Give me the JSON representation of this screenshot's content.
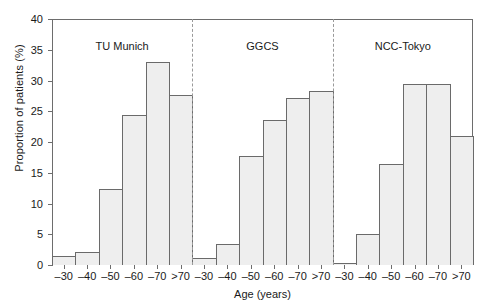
{
  "chart_data": {
    "type": "bar",
    "title": "",
    "subtitle": "",
    "xlabel": "Age (years)",
    "ylabel": "Proportion of patients (%)",
    "ylim": [
      0,
      40
    ],
    "yticks": [
      0,
      5,
      10,
      15,
      20,
      25,
      30,
      35,
      40
    ],
    "ytick_labels": [
      "0",
      "5",
      "10",
      "15",
      "20",
      "25",
      "30",
      "35",
      "40"
    ],
    "grid": false,
    "legend": "none",
    "legend_position": "none",
    "categories": [
      "–30",
      "–40",
      "–50",
      "–60",
      "–70",
      ">70"
    ],
    "panels": [
      {
        "label": "TU Munich",
        "values": [
          1.5,
          2.1,
          12.4,
          24.4,
          33.0,
          27.7
        ]
      },
      {
        "label": "GGCS",
        "values": [
          1.2,
          3.4,
          17.8,
          23.6,
          27.1,
          28.3
        ]
      },
      {
        "label": "NCC-Tokyo",
        "values": [
          0.4,
          5.0,
          16.4,
          29.4,
          29.4,
          20.9
        ]
      }
    ],
    "series": [
      {
        "name": "TU Munich",
        "values": [
          1.5,
          2.1,
          12.4,
          24.4,
          33.0,
          27.7
        ]
      },
      {
        "name": "GGCS",
        "values": [
          1.2,
          3.4,
          17.8,
          23.6,
          27.1,
          28.3
        ]
      },
      {
        "name": "NCC-Tokyo",
        "values": [
          0.4,
          5.0,
          16.4,
          29.4,
          29.4,
          20.9
        ]
      }
    ],
    "annotations": [
      {
        "text": "TU Munich",
        "kind": "panel-title"
      },
      {
        "text": "GGCS",
        "kind": "panel-title"
      },
      {
        "text": "NCC-Tokyo",
        "kind": "panel-title"
      }
    ],
    "panel_dividers": 2,
    "bar_fill_color": "#eeeeee",
    "bar_edge_color": "#6a6a6a",
    "axis_color": "#6d6d6d",
    "divider_color": "#9a9a9a",
    "background_color": "#ffffff"
  }
}
